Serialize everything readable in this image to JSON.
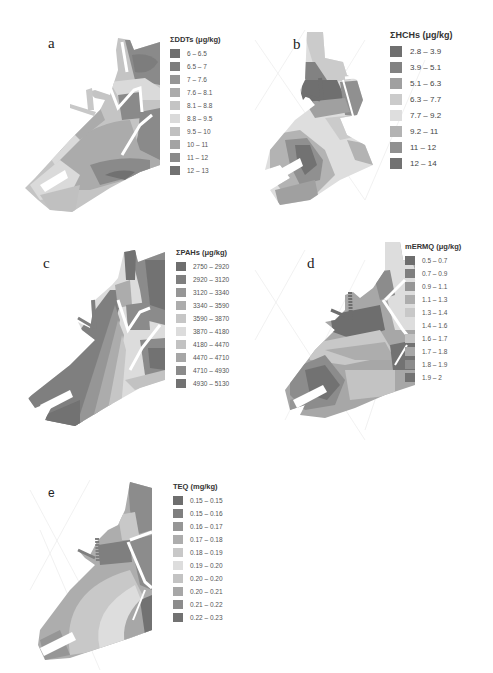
{
  "figure": {
    "panels": [
      {
        "id": "a",
        "letter": "a",
        "legend_title": "ΣDDTs (μg/kg)",
        "classes": [
          {
            "label": "6 – 6.5",
            "color": "#6e6e6e"
          },
          {
            "label": "6.5 – 7",
            "color": "#7d7d7d"
          },
          {
            "label": "7 – 7.6",
            "color": "#969696"
          },
          {
            "label": "7.6 – 8.1",
            "color": "#ababab"
          },
          {
            "label": "8.1 – 8.8",
            "color": "#c4c4c4"
          },
          {
            "label": "8.8 – 9.5",
            "color": "#dadada"
          },
          {
            "label": "9.5 – 10",
            "color": "#c0c0c0"
          },
          {
            "label": "10 – 11",
            "color": "#a3a3a3"
          },
          {
            "label": "11 – 12",
            "color": "#8a8a8a"
          },
          {
            "label": "12 – 13",
            "color": "#717171"
          }
        ]
      },
      {
        "id": "b",
        "letter": "b",
        "legend_title": "ΣHCHs (μg/kg)",
        "classes": [
          {
            "label": "2.8 – 3.9",
            "color": "#6f6f6f"
          },
          {
            "label": "3.9 – 5.1",
            "color": "#828282"
          },
          {
            "label": "5.1 – 6.3",
            "color": "#a0a0a0"
          },
          {
            "label": "6.3 – 7.7",
            "color": "#cbcbcb"
          },
          {
            "label": "7.7 – 9.2",
            "color": "#dedede"
          },
          {
            "label": "9.2 – 11",
            "color": "#b3b3b3"
          },
          {
            "label": "11 – 12",
            "color": "#909090"
          },
          {
            "label": "12 – 14",
            "color": "#727272"
          }
        ]
      },
      {
        "id": "c",
        "letter": "c",
        "legend_title": "ΣPAHs (μg/kg)",
        "classes": [
          {
            "label": "2750 – 2920",
            "color": "#6e6e6e"
          },
          {
            "label": "2920 – 3120",
            "color": "#7f7f7f"
          },
          {
            "label": "3120 – 3340",
            "color": "#969696"
          },
          {
            "label": "3340 – 3590",
            "color": "#acacac"
          },
          {
            "label": "3590 – 3870",
            "color": "#c6c6c6"
          },
          {
            "label": "3870 – 4180",
            "color": "#dcdcdc"
          },
          {
            "label": "4180 – 4470",
            "color": "#c2c2c2"
          },
          {
            "label": "4470 – 4710",
            "color": "#a6a6a6"
          },
          {
            "label": "4710 – 4930",
            "color": "#8b8b8b"
          },
          {
            "label": "4930 – 5130",
            "color": "#727272"
          }
        ]
      },
      {
        "id": "d",
        "letter": "d",
        "legend_title": "mERMQ (μg/kg)",
        "classes": [
          {
            "label": "0.5 – 0.7",
            "color": "#6e6e6e"
          },
          {
            "label": "0.7 – 0.9",
            "color": "#7f7f7f"
          },
          {
            "label": "0.9 – 1.1",
            "color": "#969696"
          },
          {
            "label": "1.1 – 1.3",
            "color": "#adadad"
          },
          {
            "label": "1.3 – 1.4",
            "color": "#c8c8c8"
          },
          {
            "label": "1.4 – 1.6",
            "color": "#dddddd"
          },
          {
            "label": "1.6 – 1.7",
            "color": "#c3c3c3"
          },
          {
            "label": "1.7 – 1.8",
            "color": "#a7a7a7"
          },
          {
            "label": "1.8 – 1.9",
            "color": "#8c8c8c"
          },
          {
            "label": "1.9 – 2",
            "color": "#727272"
          }
        ]
      },
      {
        "id": "e",
        "letter": "e",
        "legend_title": "TEQ (mg/kg)",
        "classes": [
          {
            "label": "0.15 – 0.15",
            "color": "#6e6e6e"
          },
          {
            "label": "0.15 – 0.16",
            "color": "#7f7f7f"
          },
          {
            "label": "0.16 – 0.17",
            "color": "#969696"
          },
          {
            "label": "0.17 – 0.18",
            "color": "#adadad"
          },
          {
            "label": "0.18 – 0.19",
            "color": "#c8c8c8"
          },
          {
            "label": "0.19 – 0.20",
            "color": "#dddddd"
          },
          {
            "label": "0.20 – 0.20",
            "color": "#c3c3c3"
          },
          {
            "label": "0.20 – 0.21",
            "color": "#a7a7a7"
          },
          {
            "label": "0.21 – 0.22",
            "color": "#8c8c8c"
          },
          {
            "label": "0.22 – 0.23",
            "color": "#727272"
          }
        ]
      }
    ]
  }
}
